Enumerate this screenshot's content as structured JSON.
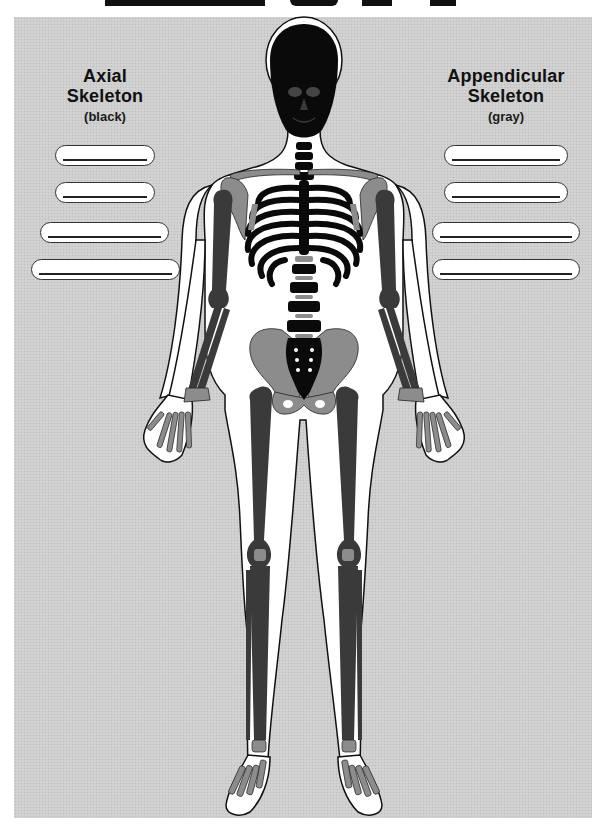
{
  "diagram": {
    "type": "labeling worksheet",
    "colors": {
      "panel_background": "#cfcfcf",
      "axial_bone": "#0a0a0a",
      "appendicular_bone_dark": "#3a3a3a",
      "appendicular_bone_light": "#8c8c8c",
      "body_outline": "#ffffff",
      "label_box": "#ffffff",
      "label_line": "#222222"
    }
  },
  "left_legend": {
    "title_line1": "Axial",
    "title_line2": "Skeleton",
    "color_hint": "(black)",
    "blanks": [
      {
        "value": "",
        "placeholder": ""
      },
      {
        "value": "",
        "placeholder": ""
      },
      {
        "value": "",
        "placeholder": ""
      },
      {
        "value": "",
        "placeholder": ""
      }
    ]
  },
  "right_legend": {
    "title_line1": "Appendicular",
    "title_line2": "Skeleton",
    "color_hint": "(gray)",
    "blanks": [
      {
        "value": "",
        "placeholder": ""
      },
      {
        "value": "",
        "placeholder": ""
      },
      {
        "value": "",
        "placeholder": ""
      },
      {
        "value": "",
        "placeholder": ""
      }
    ]
  }
}
